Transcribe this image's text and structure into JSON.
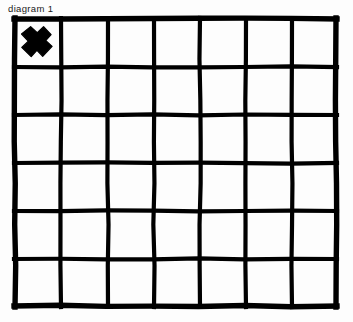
{
  "figure": {
    "caption": "diagram 1",
    "background_color": "#fdfdfd",
    "ink_color": "#000000",
    "width": 353,
    "height": 322
  },
  "grid": {
    "columns": 7,
    "rows": 6,
    "left": 15,
    "top": 19,
    "right": 336,
    "bottom": 306,
    "column_edges": [
      15,
      61,
      108,
      154,
      200,
      246,
      292,
      336
    ],
    "row_edges": [
      19,
      67,
      115,
      163,
      211,
      259,
      306
    ],
    "outer_stroke_width": 5.4,
    "inner_stroke_width": 4.2,
    "style": "hand-drawn"
  },
  "marks": [
    {
      "name": "x-mark",
      "symbol": "X",
      "row": 0,
      "column": 0,
      "center_x": 37,
      "center_y": 41,
      "arm_length": 15,
      "arm_half_width": 6.2,
      "color": "#000000"
    }
  ],
  "cells": [
    {
      "row": 0,
      "col": 0,
      "content": "X"
    },
    {
      "row": 0,
      "col": 1,
      "content": ""
    },
    {
      "row": 0,
      "col": 2,
      "content": ""
    },
    {
      "row": 0,
      "col": 3,
      "content": ""
    },
    {
      "row": 0,
      "col": 4,
      "content": ""
    },
    {
      "row": 0,
      "col": 5,
      "content": ""
    },
    {
      "row": 0,
      "col": 6,
      "content": ""
    },
    {
      "row": 1,
      "col": 0,
      "content": ""
    },
    {
      "row": 1,
      "col": 1,
      "content": ""
    },
    {
      "row": 1,
      "col": 2,
      "content": ""
    },
    {
      "row": 1,
      "col": 3,
      "content": ""
    },
    {
      "row": 1,
      "col": 4,
      "content": ""
    },
    {
      "row": 1,
      "col": 5,
      "content": ""
    },
    {
      "row": 1,
      "col": 6,
      "content": ""
    },
    {
      "row": 2,
      "col": 0,
      "content": ""
    },
    {
      "row": 2,
      "col": 1,
      "content": ""
    },
    {
      "row": 2,
      "col": 2,
      "content": ""
    },
    {
      "row": 2,
      "col": 3,
      "content": ""
    },
    {
      "row": 2,
      "col": 4,
      "content": ""
    },
    {
      "row": 2,
      "col": 5,
      "content": ""
    },
    {
      "row": 2,
      "col": 6,
      "content": ""
    },
    {
      "row": 3,
      "col": 0,
      "content": ""
    },
    {
      "row": 3,
      "col": 1,
      "content": ""
    },
    {
      "row": 3,
      "col": 2,
      "content": ""
    },
    {
      "row": 3,
      "col": 3,
      "content": ""
    },
    {
      "row": 3,
      "col": 4,
      "content": ""
    },
    {
      "row": 3,
      "col": 5,
      "content": ""
    },
    {
      "row": 3,
      "col": 6,
      "content": ""
    },
    {
      "row": 4,
      "col": 0,
      "content": ""
    },
    {
      "row": 4,
      "col": 1,
      "content": ""
    },
    {
      "row": 4,
      "col": 2,
      "content": ""
    },
    {
      "row": 4,
      "col": 3,
      "content": ""
    },
    {
      "row": 4,
      "col": 4,
      "content": ""
    },
    {
      "row": 4,
      "col": 5,
      "content": ""
    },
    {
      "row": 4,
      "col": 6,
      "content": ""
    },
    {
      "row": 5,
      "col": 0,
      "content": ""
    },
    {
      "row": 5,
      "col": 1,
      "content": ""
    },
    {
      "row": 5,
      "col": 2,
      "content": ""
    },
    {
      "row": 5,
      "col": 3,
      "content": ""
    },
    {
      "row": 5,
      "col": 4,
      "content": ""
    },
    {
      "row": 5,
      "col": 5,
      "content": ""
    },
    {
      "row": 5,
      "col": 6,
      "content": ""
    }
  ]
}
